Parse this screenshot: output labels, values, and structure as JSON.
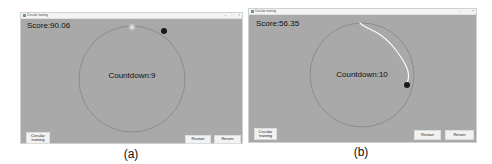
{
  "panels": [
    {
      "id": "a",
      "caption": "(a)",
      "window": {
        "title": "Circular training",
        "controls": [
          "–",
          "□",
          "×"
        ]
      },
      "score_label": "Score:90.06",
      "countdown_label": "Countdown:9",
      "mode_button": {
        "line1": "Circular",
        "line2": "training"
      },
      "buttons": {
        "restart": "Restart",
        "return": "Return"
      },
      "colors": {
        "background": "#a9a9a9",
        "circle": "#8a8a8a",
        "ball": "#1a1a1a",
        "trail": "#ffffff"
      }
    },
    {
      "id": "b",
      "caption": "(b)",
      "window": {
        "title": "Circular training",
        "controls": [
          "–",
          "□",
          "×"
        ]
      },
      "score_label": "Score:56.35",
      "countdown_label": "Countdown:10",
      "mode_button": {
        "line1": "Circular",
        "line2": "training"
      },
      "buttons": {
        "restart": "Restart",
        "return": "Return"
      },
      "colors": {
        "background": "#a9a9a9",
        "circle": "#8a8a8a",
        "ball": "#1a1a1a",
        "trail": "#ffffff"
      }
    }
  ]
}
